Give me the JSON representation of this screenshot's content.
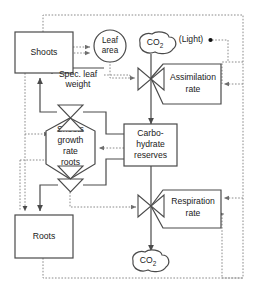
{
  "diagram": {
    "type": "forrester-stock-flow-diagram",
    "colors": {
      "background": "#ffffff",
      "node_stroke": "#4a4a4a",
      "flow_stroke": "#4a4a4a",
      "info_stroke": "#8a8a8a",
      "text": "#1a1a1a"
    },
    "nodes": {
      "shoots": {
        "label": "Shoots",
        "shape": "rectangle",
        "kind": "state-variable"
      },
      "roots": {
        "label": "Roots",
        "shape": "rectangle",
        "kind": "state-variable"
      },
      "carbohydrate_reserves": {
        "label_line1": "Carbo-",
        "label_line2": "hydrate",
        "label_line3": "reserves",
        "shape": "rectangle",
        "kind": "state-variable"
      },
      "leaf_area": {
        "label_line1": "Leaf",
        "label_line2": "area",
        "shape": "circle",
        "kind": "auxiliary"
      },
      "co2_source": {
        "label": "CO",
        "sub": "2",
        "shape": "cloud",
        "kind": "source"
      },
      "co2_sink": {
        "label": "CO",
        "sub": "2",
        "shape": "cloud",
        "kind": "sink"
      },
      "light": {
        "label": "(Light)",
        "shape": "text-with-dot",
        "kind": "driving-variable"
      },
      "spec_leaf_weight": {
        "label_line1": "Spec. leaf",
        "label_line2": "weight",
        "shape": "underlined-text",
        "kind": "auxiliary"
      },
      "assimilation_rate": {
        "label_line1": "Assimilation",
        "label_line2": "rate",
        "shape": "rate-pentagon",
        "kind": "rate-variable"
      },
      "respiration_rate": {
        "label_line1": "Respiration",
        "label_line2": "rate",
        "shape": "rate-pentagon",
        "kind": "rate-variable"
      },
      "shoots_growth_rate_roots": {
        "label_line1": "Shoots",
        "label_line2": "growth",
        "label_line3": "rate",
        "label_line4": "roots",
        "shape": "hexagon",
        "kind": "rate-variable"
      }
    },
    "valves": [
      {
        "name": "assimilation-valve",
        "shape": "bowtie"
      },
      {
        "name": "respiration-valve",
        "shape": "bowtie"
      },
      {
        "name": "shoots-growth-valve-top",
        "shape": "bowtie"
      },
      {
        "name": "roots-growth-valve-bottom",
        "shape": "bowtie"
      }
    ],
    "flows": [
      {
        "from": "co2_source",
        "to": "carbohydrate_reserves",
        "via": "assimilation_rate",
        "style": "solid"
      },
      {
        "from": "carbohydrate_reserves",
        "to": "co2_sink",
        "via": "respiration_rate",
        "style": "solid"
      },
      {
        "from": "carbohydrate_reserves",
        "to": "shoots",
        "via": "shoots_growth_rate_roots",
        "style": "solid"
      },
      {
        "from": "carbohydrate_reserves",
        "to": "roots",
        "via": "shoots_growth_rate_roots",
        "style": "solid"
      }
    ],
    "information_links": [
      {
        "from": "shoots",
        "to": "leaf_area",
        "style": "dotted"
      },
      {
        "from": "spec_leaf_weight",
        "to": "leaf_area",
        "style": "dotted"
      },
      {
        "from": "spec_leaf_weight",
        "to": "assimilation_rate",
        "style": "dotted"
      },
      {
        "from": "light",
        "to": "assimilation_rate",
        "style": "dotted"
      },
      {
        "from": "leaf_area",
        "to": "assimilation_rate",
        "style": "dotted"
      },
      {
        "from": "carbohydrate_reserves",
        "to": "shoots_growth_rate_roots",
        "style": "dotted"
      },
      {
        "from": "shoots",
        "to": "shoots_growth_rate_roots",
        "style": "dotted"
      },
      {
        "from": "shoots",
        "to": "roots",
        "style": "dotted"
      },
      {
        "from": "roots",
        "to": "respiration_rate",
        "style": "dotted"
      },
      {
        "from": "roots",
        "to": "shoots_growth_rate_roots",
        "style": "dotted"
      },
      {
        "from": "shoots",
        "to": "respiration_rate",
        "style": "dotted"
      }
    ]
  }
}
